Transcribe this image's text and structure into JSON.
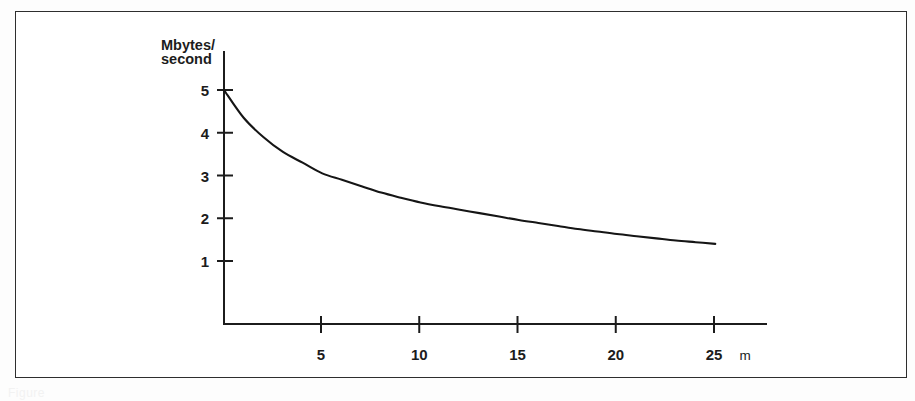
{
  "figure": {
    "caption_fragment": "Figure"
  },
  "chart_data": {
    "type": "line",
    "title": "",
    "subtitle": "",
    "xlabel": "m",
    "ylabel": "Mbytes/second",
    "ylabel_line1": "Mbytes/",
    "ylabel_line2": "second",
    "grid": false,
    "legend": "none",
    "xlim": [
      0,
      27.5
    ],
    "ylim": [
      0,
      5.4
    ],
    "xticks": [
      5,
      10,
      15,
      20,
      25
    ],
    "xtick_labels": [
      "5",
      "10",
      "15",
      "20",
      "25"
    ],
    "yticks": [
      1,
      2,
      3,
      4,
      5
    ],
    "ytick_labels": [
      "1",
      "2",
      "3",
      "4",
      "5"
    ],
    "x_unit_label": "m",
    "series": [
      {
        "name": "transfer-rate",
        "x": [
          0,
          1,
          2,
          3,
          4,
          5,
          6,
          7,
          8,
          9,
          10,
          11,
          12,
          13,
          14,
          15,
          16,
          17,
          18,
          19,
          20,
          21,
          22,
          23,
          24,
          25
        ],
        "values": [
          5.0,
          4.35,
          3.9,
          3.55,
          3.3,
          3.05,
          2.9,
          2.75,
          2.6,
          2.48,
          2.37,
          2.28,
          2.2,
          2.12,
          2.04,
          1.96,
          1.89,
          1.82,
          1.75,
          1.69,
          1.63,
          1.58,
          1.53,
          1.48,
          1.44,
          1.4
        ]
      }
    ],
    "colors": {
      "curve": "#151515",
      "axis": "#1c1c1c",
      "background": "#ffffff",
      "frame": "#2e2e2e"
    },
    "annotations": []
  }
}
